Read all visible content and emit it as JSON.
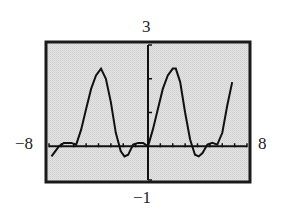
{
  "window": {
    "xmin_label": "−8",
    "xmax_label": "8",
    "ymin_label": "−1",
    "ymax_label": "3"
  },
  "colors": {
    "screen_bg": "#dcdcdc",
    "frame": "#1a1a1a",
    "curve": "#111111",
    "axes": "#111111"
  },
  "chart_data": {
    "type": "line",
    "title": "",
    "xlabel": "",
    "ylabel": "",
    "xlim": [
      -8,
      8
    ],
    "ylim": [
      -1,
      3
    ],
    "grid": false,
    "legend": null,
    "x_tick_step": 1,
    "y_tick_step": 1,
    "tick_labels": {
      "x_min": "−8",
      "x_max": "8",
      "y_min": "−1",
      "y_max": "3"
    },
    "series": [
      {
        "name": "f(x)",
        "x": [
          -7.8,
          -7.2,
          -6.8,
          -6.2,
          -5.8,
          -5.4,
          -5.0,
          -4.6,
          -4.2,
          -3.8,
          -3.4,
          -3.0,
          -2.6,
          -2.2,
          -1.9,
          -1.6,
          -1.2,
          -0.8,
          -0.4,
          0.0,
          0.4,
          0.8,
          1.2,
          1.6,
          2.0,
          2.25,
          2.6,
          3.0,
          3.4,
          3.8,
          4.1,
          4.4,
          4.8,
          5.2,
          5.6,
          6.0,
          6.4,
          6.8
        ],
        "y": [
          -0.3,
          0.0,
          0.1,
          0.1,
          0.05,
          0.5,
          1.1,
          1.7,
          2.1,
          2.3,
          2.0,
          1.3,
          0.4,
          -0.15,
          -0.3,
          -0.25,
          0.05,
          0.1,
          0.1,
          0.0,
          0.5,
          1.1,
          1.7,
          2.1,
          2.3,
          2.3,
          1.9,
          1.0,
          0.2,
          -0.25,
          -0.3,
          -0.2,
          0.05,
          0.1,
          0.05,
          0.4,
          1.2,
          1.9
        ]
      }
    ]
  }
}
